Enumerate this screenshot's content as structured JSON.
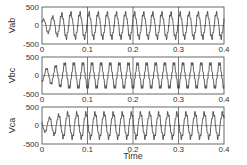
{
  "chart_data": [
    {
      "type": "line",
      "title": "",
      "xlabel": "",
      "ylabel": "Vab",
      "xlim": [
        0,
        0.4
      ],
      "ylim": [
        -500,
        500
      ],
      "xticks": [
        "0",
        "0.1",
        "0.2",
        "0.3",
        "0.4"
      ],
      "yticks": [
        "-500",
        "0",
        "500"
      ],
      "grid": "vertical at x ticks",
      "waveform": {
        "frequency_hz": 50,
        "amplitude_steady": 330,
        "phase_deg": 30,
        "ramp_time_s": 0.05,
        "shape": "sinusoid with PWM ripple"
      },
      "x": [
        0,
        0.05,
        0.1,
        0.15,
        0.2,
        0.25,
        0.3,
        0.35,
        0.4
      ],
      "peaks": [
        150,
        330,
        330,
        330,
        330,
        330,
        330,
        330,
        330
      ]
    },
    {
      "type": "line",
      "title": "",
      "xlabel": "",
      "ylabel": "Vbc",
      "xlim": [
        0,
        0.4
      ],
      "ylim": [
        -500,
        500
      ],
      "xticks": [
        "0",
        "0.1",
        "0.2",
        "0.3",
        "0.4"
      ],
      "yticks": [
        "-500",
        "0",
        "500"
      ],
      "grid": "vertical at x ticks",
      "waveform": {
        "frequency_hz": 50,
        "amplitude_steady": 330,
        "phase_deg": -90,
        "ramp_time_s": 0.05,
        "shape": "sinusoid with PWM ripple"
      },
      "x": [
        0,
        0.05,
        0.1,
        0.15,
        0.2,
        0.25,
        0.3,
        0.35,
        0.4
      ],
      "peaks": [
        150,
        330,
        330,
        330,
        330,
        330,
        330,
        330,
        330
      ]
    },
    {
      "type": "line",
      "title": "",
      "xlabel": "Time",
      "ylabel": "Vca",
      "xlim": [
        0,
        0.4
      ],
      "ylim": [
        -500,
        500
      ],
      "xticks": [
        "0",
        "0.1",
        "0.2",
        "0.3",
        "0.4"
      ],
      "yticks": [
        "-500",
        "0",
        "500"
      ],
      "grid": "vertical at x ticks",
      "waveform": {
        "frequency_hz": 50,
        "amplitude_steady": 330,
        "phase_deg": 150,
        "ramp_time_s": 0.05,
        "shape": "sinusoid with PWM ripple"
      },
      "x": [
        0,
        0.05,
        0.1,
        0.15,
        0.2,
        0.25,
        0.3,
        0.35,
        0.4
      ],
      "peaks": [
        150,
        330,
        330,
        330,
        330,
        330,
        330,
        330,
        330
      ]
    }
  ],
  "panels": [
    {
      "ylabel": "Vab",
      "ytick_top": "500",
      "ytick_mid": "0",
      "ytick_bot": "-500"
    },
    {
      "ylabel": "Vbc",
      "ytick_top": "500",
      "ytick_mid": "0",
      "ytick_bot": "-500"
    },
    {
      "ylabel": "Vca",
      "ytick_top": "500",
      "ytick_mid": "0",
      "ytick_bot": "-500"
    }
  ],
  "xticks": [
    "0",
    "0.1",
    "0.2",
    "0.3",
    "0.4"
  ],
  "xlabel": "Time"
}
